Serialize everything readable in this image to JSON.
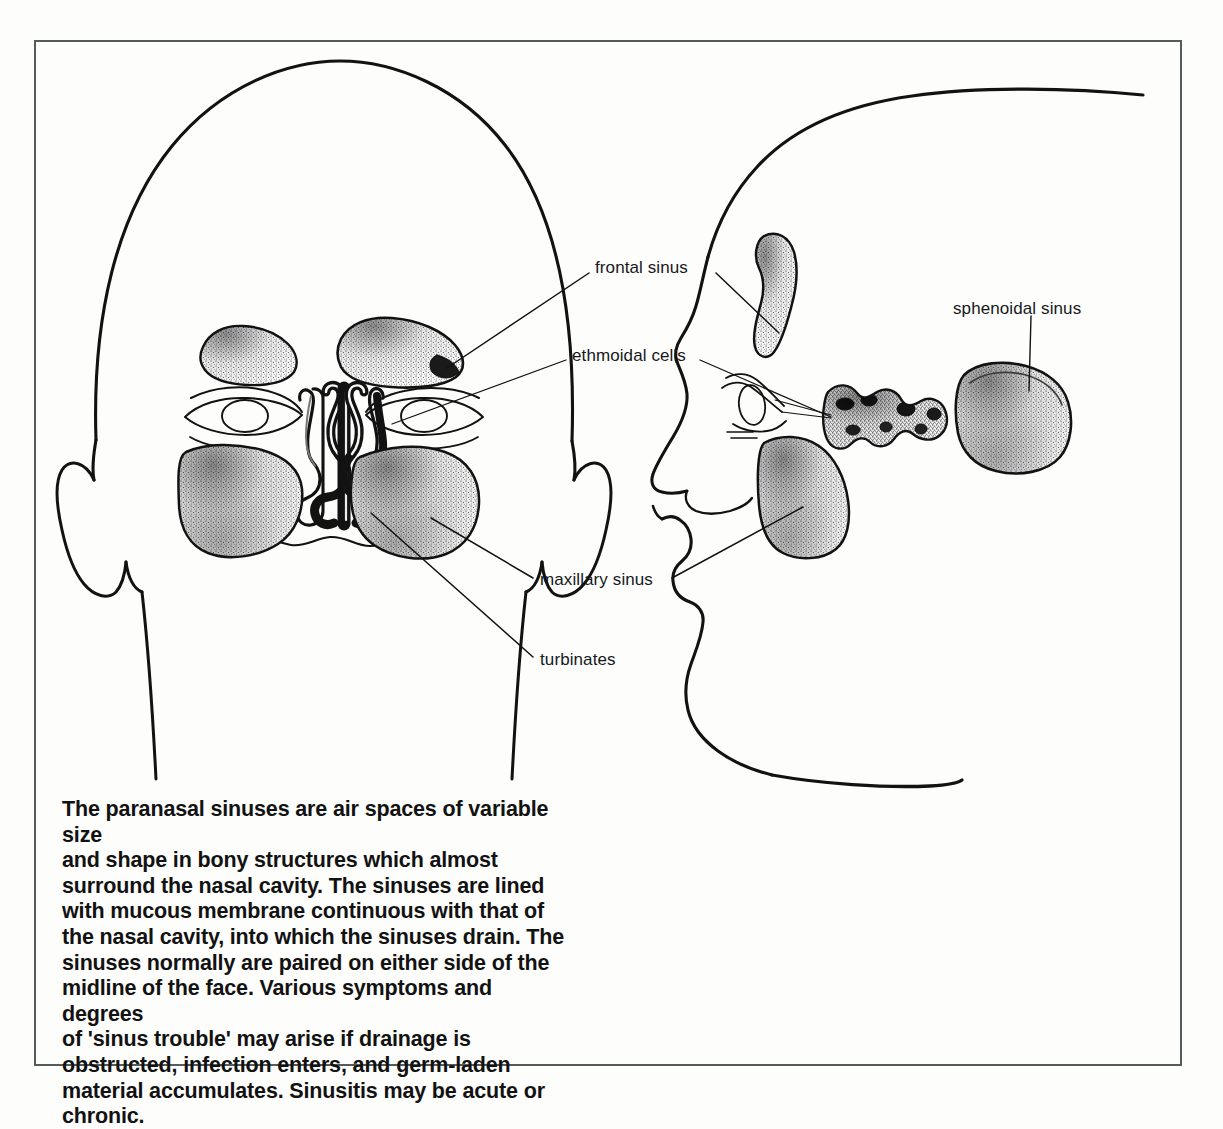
{
  "figure": {
    "title": "Paranasal sinuses",
    "frame": {
      "border_color": "#555a5c"
    },
    "background_color": "#fdfdfc",
    "ink_color": "#121212"
  },
  "labels": [
    {
      "id": "frontal-sinus",
      "text": "frontal sinus",
      "x": 595,
      "y": 265
    },
    {
      "id": "ethmoidal-cells",
      "text": "ethmoidal cells",
      "x": 572,
      "y": 353
    },
    {
      "id": "sphenoidal-sinus",
      "text": "sphenoidal sinus",
      "x": 953,
      "y": 306
    },
    {
      "id": "maxillary-sinus",
      "text": "maxillary sinus",
      "x": 538,
      "y": 577
    },
    {
      "id": "turbinates",
      "text": "turbinates",
      "x": 538,
      "y": 659
    }
  ],
  "caption": {
    "text": "The paranasal sinuses are air spaces of variable size\nand shape in bony structures which almost\nsurround the nasal cavity. The sinuses are lined\nwith mucous membrane continuous with that of\nthe nasal cavity, into which the sinuses drain. The\nsinuses normally are paired on either side of the\nmidline of the face. Various symptoms and degrees\nof 'sinus trouble' may arise if drainage is\nobstructed, infection enters, and germ-laden\nmaterial accumulates. Sinusitis may be acute or\nchronic."
  },
  "anatomy": {
    "views": [
      {
        "id": "frontal-view",
        "name": "anterior head view"
      },
      {
        "id": "profile-view",
        "name": "lateral head profile view"
      }
    ],
    "structures": [
      {
        "id": "frontal-sinus-left",
        "name": "frontal sinus (left)",
        "view": "frontal-view"
      },
      {
        "id": "frontal-sinus-right",
        "name": "frontal sinus (right)",
        "view": "frontal-view"
      },
      {
        "id": "eye-left",
        "name": "eye (left)",
        "view": "frontal-view"
      },
      {
        "id": "eye-right",
        "name": "eye (right)",
        "view": "frontal-view"
      },
      {
        "id": "nasal-cavity-turbinates",
        "name": "nasal cavity with turbinates",
        "view": "frontal-view"
      },
      {
        "id": "maxillary-sinus-left",
        "name": "maxillary sinus (left)",
        "view": "frontal-view"
      },
      {
        "id": "maxillary-sinus-right",
        "name": "maxillary sinus (right)",
        "view": "frontal-view"
      },
      {
        "id": "frontal-sinus-profile",
        "name": "frontal sinus",
        "view": "profile-view"
      },
      {
        "id": "ethmoidal-cells-profile",
        "name": "ethmoidal cells",
        "view": "profile-view"
      },
      {
        "id": "maxillary-sinus-profile",
        "name": "maxillary sinus",
        "view": "profile-view"
      },
      {
        "id": "sphenoidal-sinus-profile",
        "name": "sphenoidal sinus",
        "view": "profile-view"
      }
    ]
  }
}
